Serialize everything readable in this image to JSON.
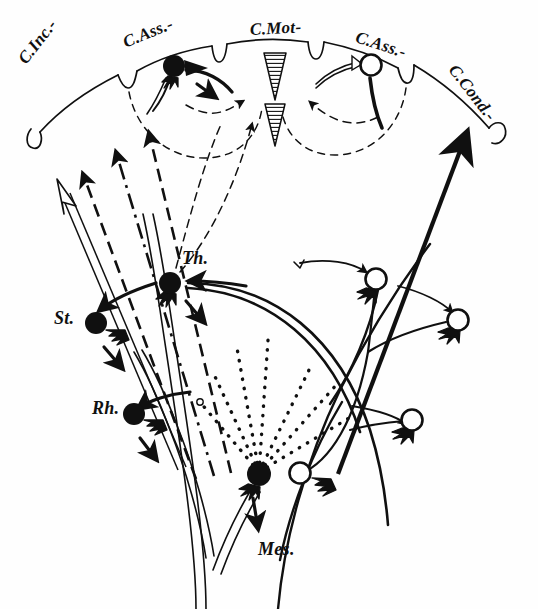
{
  "figure": {
    "background_color": "#fefefe",
    "ink_color": "#101010"
  },
  "cortex_labels": [
    {
      "id": "c-inc",
      "text": "C.Inc.-",
      "x": 22,
      "y": 52,
      "rotate": -52,
      "region": "cortex-incitans"
    },
    {
      "id": "c-ass-l",
      "text": "C.Ass.-",
      "x": 124,
      "y": 33,
      "rotate": -22,
      "region": "cortex-associationis-left"
    },
    {
      "id": "c-mot",
      "text": "C.Mot-",
      "x": 250,
      "y": 20,
      "rotate": -3,
      "region": "cortex-motoria"
    },
    {
      "id": "c-ass-r",
      "text": "C.Ass.-",
      "x": 356,
      "y": 27,
      "rotate": 18,
      "region": "cortex-associationis-right"
    },
    {
      "id": "c-cond",
      "text": "C.Cond.-",
      "x": 452,
      "y": 57,
      "rotate": 52,
      "region": "cortex-conducens"
    }
  ],
  "nucleus_labels": [
    {
      "id": "th",
      "text": "Th.",
      "x": 182,
      "y": 248,
      "rotate": 0,
      "region": "thalamus"
    },
    {
      "id": "st",
      "text": "St.",
      "x": 54,
      "y": 308,
      "rotate": 0,
      "region": "striatum"
    },
    {
      "id": "rh",
      "text": "Rh.",
      "x": 92,
      "y": 398,
      "rotate": 0,
      "region": "rhinencephalon"
    },
    {
      "id": "mes",
      "text": "Mes.",
      "x": 258,
      "y": 539,
      "rotate": 0,
      "region": "mesencephalon"
    }
  ],
  "neurons": [
    {
      "id": "n-cass-left",
      "type": "filled",
      "cx": 174,
      "cy": 66,
      "r": 11
    },
    {
      "id": "n-cass-right",
      "type": "open",
      "cx": 371,
      "cy": 65,
      "r": 11
    },
    {
      "id": "n-thalamus",
      "type": "filled",
      "cx": 170,
      "cy": 283,
      "r": 11
    },
    {
      "id": "n-striatum",
      "type": "filled",
      "cx": 96,
      "cy": 323,
      "r": 11
    },
    {
      "id": "n-rhinenceph",
      "type": "filled",
      "cx": 134,
      "cy": 414,
      "r": 11
    },
    {
      "id": "n-mes-filled",
      "type": "filled",
      "cx": 259,
      "cy": 474,
      "r": 12
    },
    {
      "id": "n-mes-open",
      "type": "open",
      "cx": 300,
      "cy": 473,
      "r": 11
    },
    {
      "id": "n-right-upper",
      "type": "open",
      "cx": 376,
      "cy": 279,
      "r": 11
    },
    {
      "id": "n-right-mid",
      "type": "open",
      "cx": 458,
      "cy": 320,
      "r": 11
    },
    {
      "id": "n-right-lower",
      "type": "open",
      "cx": 412,
      "cy": 420,
      "r": 11
    }
  ],
  "motor_triangles": [
    {
      "id": "tri-upper",
      "cx": 275,
      "cy": 75,
      "w": 22,
      "h": 46,
      "fill": "hatched"
    },
    {
      "id": "tri-lower",
      "cx": 275,
      "cy": 123,
      "w": 20,
      "h": 42,
      "fill": "hatched"
    }
  ],
  "arrows": {
    "incitans_bundle": [
      {
        "id": "arrow-hollow",
        "style": "hollow"
      },
      {
        "id": "arrow-dashed-1",
        "style": "dashed"
      },
      {
        "id": "arrow-dashdot-2",
        "style": "dash-dot"
      },
      {
        "id": "arrow-dashed-3",
        "style": "dashed"
      }
    ],
    "conducens": {
      "id": "arrow-conducens",
      "style": "solid-thick"
    }
  },
  "dotted_fan": {
    "id": "dotted-fan",
    "origin_x": 259,
    "origin_y": 472,
    "ray_count": 7
  }
}
